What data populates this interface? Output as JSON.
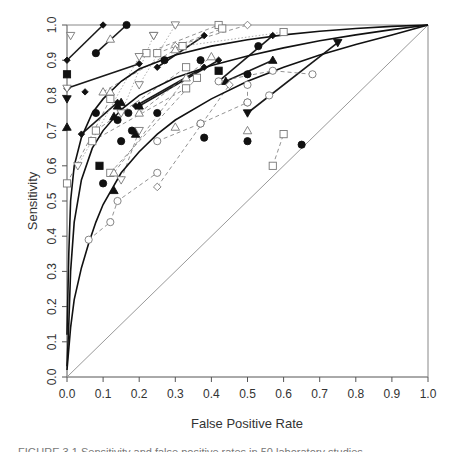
{
  "chart_data": {
    "type": "scatter",
    "title": "",
    "xlabel": "False Positive Rate",
    "ylabel": "Sensitivity",
    "xlim": [
      0,
      1
    ],
    "ylim": [
      0,
      1
    ],
    "xticks": [
      "0.0",
      "0.1",
      "0.2",
      "0.3",
      "0.4",
      "0.5",
      "0.6",
      "0.7",
      "0.8",
      "0.9",
      "1.0"
    ],
    "yticks": [
      "0.0",
      "0.1",
      "0.2",
      "0.3",
      "0.4",
      "0.5",
      "0.6",
      "0.7",
      "0.8",
      "0.9",
      "1.0"
    ],
    "grid": false,
    "legend": null,
    "reference_line": {
      "name": "chance diagonal",
      "points": [
        [
          0,
          0
        ],
        [
          1,
          1
        ]
      ],
      "color": "#999999"
    },
    "summary_roc_curves": [
      {
        "name": "upper curve",
        "points": [
          [
            0,
            0.12
          ],
          [
            0.005,
            0.35
          ],
          [
            0.01,
            0.5
          ],
          [
            0.02,
            0.6
          ],
          [
            0.04,
            0.68
          ],
          [
            0.07,
            0.75
          ],
          [
            0.1,
            0.79
          ],
          [
            0.15,
            0.84
          ],
          [
            0.2,
            0.875
          ],
          [
            0.3,
            0.915
          ],
          [
            0.4,
            0.94
          ],
          [
            0.5,
            0.958
          ],
          [
            0.6,
            0.972
          ],
          [
            0.7,
            0.982
          ],
          [
            0.8,
            0.99
          ],
          [
            0.9,
            0.996
          ],
          [
            1,
            1
          ]
        ]
      },
      {
        "name": "middle curve",
        "points": [
          [
            0,
            0.03
          ],
          [
            0.005,
            0.15
          ],
          [
            0.01,
            0.3
          ],
          [
            0.02,
            0.44
          ],
          [
            0.04,
            0.56
          ],
          [
            0.07,
            0.65
          ],
          [
            0.1,
            0.7
          ],
          [
            0.15,
            0.76
          ],
          [
            0.2,
            0.8
          ],
          [
            0.3,
            0.85
          ],
          [
            0.4,
            0.885
          ],
          [
            0.5,
            0.912
          ],
          [
            0.6,
            0.935
          ],
          [
            0.7,
            0.955
          ],
          [
            0.8,
            0.972
          ],
          [
            0.9,
            0.987
          ],
          [
            1,
            1
          ]
        ]
      },
      {
        "name": "lower curve",
        "points": [
          [
            0,
            0.02
          ],
          [
            0.01,
            0.14
          ],
          [
            0.02,
            0.22
          ],
          [
            0.04,
            0.31
          ],
          [
            0.06,
            0.38
          ],
          [
            0.08,
            0.44
          ],
          [
            0.1,
            0.49
          ],
          [
            0.15,
            0.58
          ],
          [
            0.2,
            0.64
          ],
          [
            0.25,
            0.69
          ],
          [
            0.3,
            0.73
          ],
          [
            0.4,
            0.79
          ],
          [
            0.5,
            0.84
          ],
          [
            0.6,
            0.88
          ],
          [
            0.7,
            0.915
          ],
          [
            0.8,
            0.945
          ],
          [
            0.9,
            0.972
          ],
          [
            1,
            1
          ]
        ]
      }
    ],
    "study_series": [
      {
        "marker": "diamond-filled",
        "line": "solid-bold",
        "points": [
          [
            0,
            0.9
          ],
          [
            0.1,
            1.0
          ]
        ]
      },
      {
        "marker": "circle-filled",
        "line": "solid-bold",
        "points": [
          [
            0.08,
            0.92
          ],
          [
            0.165,
            1.0
          ]
        ]
      },
      {
        "marker": "diamond-filled",
        "line": "solid-bold",
        "points": [
          [
            0,
            0.82
          ],
          [
            0.2,
            0.89
          ]
        ]
      },
      {
        "marker": "diamond-filled",
        "line": "solid-bold",
        "points": [
          [
            0.04,
            0.69
          ],
          [
            0.14,
            0.78
          ]
        ]
      },
      {
        "marker": "diamond-filled",
        "line": "solid-bold",
        "points": [
          [
            0.19,
            0.77
          ],
          [
            0.38,
            0.88
          ]
        ]
      },
      {
        "marker": "diamond-filled",
        "line": "solid-bold",
        "points": [
          [
            0.2,
            0.77
          ],
          [
            0.42,
            0.9
          ]
        ]
      },
      {
        "marker": "diamond-filled",
        "line": "solid-bold",
        "points": [
          [
            0.42,
            0.84
          ],
          [
            0.57,
            0.97
          ]
        ]
      },
      {
        "marker": "triangle-filled",
        "line": "solid-bold",
        "points": [
          [
            0.44,
            0.84
          ],
          [
            0.57,
            0.9
          ]
        ]
      },
      {
        "marker": "triangle-down-filled",
        "line": "solid-bold",
        "points": [
          [
            0.5,
            0.75
          ],
          [
            0.75,
            0.95
          ]
        ]
      },
      {
        "marker": "diamond-filled",
        "line": "solid-bold",
        "points": [
          [
            0.25,
            0.88
          ],
          [
            0.38,
            0.97
          ]
        ]
      },
      {
        "marker": "square-open",
        "line": "dashed",
        "points": [
          [
            0.22,
            0.92
          ],
          [
            0.42,
            1.0
          ]
        ]
      },
      {
        "marker": "square-open",
        "line": "dashed",
        "points": [
          [
            0.25,
            0.92
          ],
          [
            0.43,
            0.99
          ]
        ]
      },
      {
        "marker": "diamond-open",
        "line": "dashed",
        "points": [
          [
            0.3,
            0.94
          ],
          [
            0.5,
            1.0
          ]
        ]
      },
      {
        "marker": "square-open",
        "line": "dotted",
        "points": [
          [
            0.32,
            0.94
          ],
          [
            0.6,
            0.98
          ]
        ]
      },
      {
        "marker": "triangle-down-open",
        "line": "dotted",
        "points": [
          [
            0.2,
            0.83
          ],
          [
            0.3,
            1.0
          ]
        ]
      },
      {
        "marker": "triangle-down-open",
        "line": "dotted",
        "points": [
          [
            0.15,
            0.75
          ],
          [
            0.24,
            0.97
          ]
        ]
      },
      {
        "marker": "triangle-down-open",
        "line": "dotted",
        "points": [
          [
            0.03,
            0.6
          ],
          [
            0.2,
            0.91
          ]
        ]
      },
      {
        "marker": "square-open",
        "line": "dashed",
        "points": [
          [
            0,
            0.55
          ],
          [
            0.12,
            0.79
          ]
        ]
      },
      {
        "marker": "square-open",
        "line": "dashed",
        "points": [
          [
            0.08,
            0.7
          ],
          [
            0.33,
            0.88
          ]
        ]
      },
      {
        "marker": "square-open",
        "line": "dashed",
        "points": [
          [
            0.07,
            0.67
          ],
          [
            0.33,
            0.82
          ]
        ]
      },
      {
        "marker": "square-open",
        "line": "dashed",
        "points": [
          [
            0.12,
            0.58
          ],
          [
            0.36,
            0.85
          ]
        ]
      },
      {
        "marker": "triangle-open",
        "line": "dashed",
        "points": [
          [
            0.1,
            0.81
          ],
          [
            0.3,
            0.93
          ]
        ]
      },
      {
        "marker": "triangle-open",
        "line": "dashed",
        "points": [
          [
            0.13,
            0.58
          ],
          [
            0.33,
            0.85
          ]
        ]
      },
      {
        "marker": "diamond-open",
        "line": "dashed",
        "points": [
          [
            0.25,
            0.54
          ],
          [
            0.45,
            0.83
          ]
        ]
      },
      {
        "marker": "circle-open",
        "line": "dashed",
        "points": [
          [
            0.06,
            0.39
          ],
          [
            0.12,
            0.44
          ],
          [
            0.14,
            0.5
          ],
          [
            0.25,
            0.58
          ]
        ]
      },
      {
        "marker": "circle-open",
        "line": "dashed",
        "points": [
          [
            0.25,
            0.67
          ],
          [
            0.37,
            0.72
          ],
          [
            0.5,
            0.78
          ]
        ]
      },
      {
        "marker": "circle-open",
        "line": "dashed",
        "points": [
          [
            0.5,
            0.83
          ],
          [
            0.5,
            0.78
          ]
        ]
      },
      {
        "marker": "circle-open",
        "line": "dashed",
        "points": [
          [
            0.42,
            0.84
          ],
          [
            0.57,
            0.87
          ],
          [
            0.68,
            0.86
          ]
        ]
      },
      {
        "marker": "square-open",
        "line": "dashed",
        "points": [
          [
            0.57,
            0.6
          ],
          [
            0.6,
            0.69
          ]
        ]
      },
      {
        "marker": "triangle-down-open",
        "line": "dashed",
        "points": [
          [
            0.15,
            0.56
          ],
          [
            0.2,
            0.7
          ]
        ]
      },
      {
        "marker": "triangle-open",
        "line": "dashed",
        "points": [
          [
            0.2,
            0.75
          ],
          [
            0.4,
            0.91
          ]
        ]
      }
    ],
    "single_points": [
      {
        "marker": "triangle-down-open",
        "x": 0.01,
        "y": 0.97
      },
      {
        "marker": "triangle-open",
        "x": 0.12,
        "y": 0.96
      },
      {
        "marker": "triangle-down-open",
        "x": 0.24,
        "y": 0.97
      },
      {
        "marker": "square-filled",
        "x": 0,
        "y": 0.86
      },
      {
        "marker": "triangle-down-filled",
        "x": 0,
        "y": 0.79
      },
      {
        "marker": "triangle-filled",
        "x": 0,
        "y": 0.71
      },
      {
        "marker": "triangle-down-open",
        "x": 0,
        "y": 0.82
      },
      {
        "marker": "diamond-filled",
        "x": 0.05,
        "y": 0.81
      },
      {
        "marker": "triangle-open",
        "x": 0.12,
        "y": 0.81
      },
      {
        "marker": "circle-filled",
        "x": 0.08,
        "y": 0.75
      },
      {
        "marker": "circle-filled",
        "x": 0.14,
        "y": 0.73
      },
      {
        "marker": "circle-filled",
        "x": 0.15,
        "y": 0.67
      },
      {
        "marker": "circle-filled",
        "x": 0.17,
        "y": 0.75
      },
      {
        "marker": "circle-filled",
        "x": 0.25,
        "y": 0.75
      },
      {
        "marker": "circle-filled",
        "x": 0.18,
        "y": 0.7
      },
      {
        "marker": "triangle-filled",
        "x": 0.19,
        "y": 0.69
      },
      {
        "marker": "triangle-filled",
        "x": 0.13,
        "y": 0.74
      },
      {
        "marker": "triangle-filled",
        "x": 0.14,
        "y": 0.77
      },
      {
        "marker": "triangle-filled",
        "x": 0.15,
        "y": 0.78
      },
      {
        "marker": "triangle-filled",
        "x": 0.2,
        "y": 0.77
      },
      {
        "marker": "square-filled",
        "x": 0.09,
        "y": 0.6
      },
      {
        "marker": "circle-filled",
        "x": 0.1,
        "y": 0.55
      },
      {
        "marker": "triangle-filled",
        "x": 0.13,
        "y": 0.53
      },
      {
        "marker": "circle-filled",
        "x": 0.27,
        "y": 0.9
      },
      {
        "marker": "circle-filled",
        "x": 0.37,
        "y": 0.9
      },
      {
        "marker": "square-filled",
        "x": 0.42,
        "y": 0.87
      },
      {
        "marker": "circle-filled",
        "x": 0.38,
        "y": 0.68
      },
      {
        "marker": "circle-filled",
        "x": 0.53,
        "y": 0.94
      },
      {
        "marker": "circle-filled",
        "x": 0.5,
        "y": 0.86
      },
      {
        "marker": "circle-filled",
        "x": 0.5,
        "y": 0.67
      },
      {
        "marker": "triangle-open",
        "x": 0.5,
        "y": 0.7
      },
      {
        "marker": "circle-open",
        "x": 0.56,
        "y": 0.8
      },
      {
        "marker": "circle-filled",
        "x": 0.65,
        "y": 0.66
      },
      {
        "marker": "triangle-open",
        "x": 0.3,
        "y": 0.71
      },
      {
        "marker": "circle-open",
        "x": 0.37,
        "y": 0.72
      }
    ]
  },
  "axes": {
    "xlabel": "False Positive Rate",
    "ylabel": "Sensitivity",
    "xticks": [
      "0.0",
      "0.1",
      "0.2",
      "0.3",
      "0.4",
      "0.5",
      "0.6",
      "0.7",
      "0.8",
      "0.9",
      "1.0"
    ],
    "yticks": [
      "0.0",
      "0.1",
      "0.2",
      "0.3",
      "0.4",
      "0.5",
      "0.6",
      "0.7",
      "0.8",
      "0.9",
      "1.0"
    ]
  },
  "caption": "FIGURE 3.1 Sensitivity and false positive rates in 50 laboratory studies"
}
